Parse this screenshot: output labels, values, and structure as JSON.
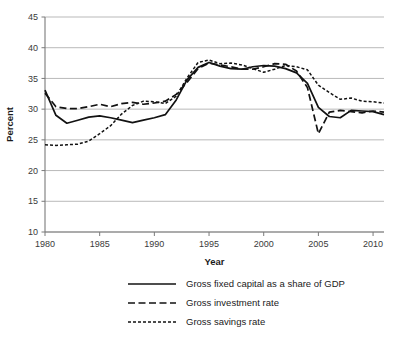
{
  "chart_data": {
    "type": "line",
    "title": "",
    "xlabel": "Year",
    "ylabel": "Percent",
    "xlim": [
      1980,
      2011
    ],
    "ylim": [
      10,
      45
    ],
    "yticks": [
      10,
      15,
      20,
      25,
      30,
      35,
      40,
      45
    ],
    "xticks": [
      1980,
      1985,
      1990,
      1995,
      2000,
      2005,
      2010
    ],
    "xtick_labels": [
      "1980",
      "1985",
      "1990",
      "1995",
      "2000",
      "2005",
      "2010"
    ],
    "ytick_labels": [
      "10",
      "15",
      "20",
      "25",
      "30",
      "35",
      "40",
      "45"
    ],
    "grid": "horizontal",
    "legend_position": "bottom-center",
    "x": [
      1980,
      1981,
      1982,
      1983,
      1984,
      1985,
      1986,
      1987,
      1988,
      1989,
      1990,
      1991,
      1992,
      1993,
      1994,
      1995,
      1996,
      1997,
      1998,
      1999,
      2000,
      2001,
      2002,
      2003,
      2004,
      2005,
      2006,
      2007,
      2008,
      2009,
      2010,
      2011
    ],
    "series": [
      {
        "name": "Gross fixed capital as a share of GDP",
        "style": "solid",
        "color": "#121212",
        "values": [
          33.1,
          29.0,
          27.7,
          28.2,
          28.7,
          28.9,
          28.6,
          28.2,
          27.8,
          28.2,
          28.6,
          29.1,
          31.5,
          34.8,
          36.8,
          37.6,
          37.0,
          36.6,
          36.5,
          36.9,
          37.1,
          37.0,
          36.6,
          35.9,
          34.2,
          30.3,
          28.8,
          28.6,
          29.8,
          29.7,
          29.6,
          29.1
        ]
      },
      {
        "name": "Gross investment rate",
        "style": "dashed-long",
        "color": "#121212",
        "values": [
          32.6,
          30.4,
          30.1,
          30.1,
          30.4,
          30.8,
          30.4,
          30.9,
          31.1,
          30.8,
          31.0,
          31.3,
          32.4,
          34.4,
          36.6,
          37.5,
          37.2,
          36.9,
          36.5,
          36.5,
          36.9,
          37.4,
          37.3,
          36.2,
          33.5,
          26.0,
          29.5,
          29.8,
          29.6,
          29.4,
          29.7,
          29.5
        ]
      },
      {
        "name": "Gross savings rate",
        "style": "dashed-short",
        "color": "#121212",
        "values": [
          24.2,
          24.1,
          24.2,
          24.3,
          24.8,
          26.0,
          27.3,
          29.2,
          30.6,
          31.3,
          31.2,
          30.9,
          32.1,
          35.1,
          37.6,
          38.0,
          37.4,
          37.5,
          37.2,
          36.6,
          36.0,
          36.5,
          37.1,
          36.9,
          36.4,
          33.9,
          32.7,
          31.6,
          31.8,
          31.3,
          31.2,
          31.0
        ]
      }
    ],
    "annotations": []
  },
  "legend": {
    "items": [
      {
        "label": "Gross fixed capital as a share of GDP",
        "style": "solid"
      },
      {
        "label": "Gross investment rate",
        "style": "dashed-long"
      },
      {
        "label": "Gross savings rate",
        "style": "dashed-short"
      }
    ]
  },
  "axes": {
    "y_title": "Percent",
    "x_title": "Year"
  }
}
